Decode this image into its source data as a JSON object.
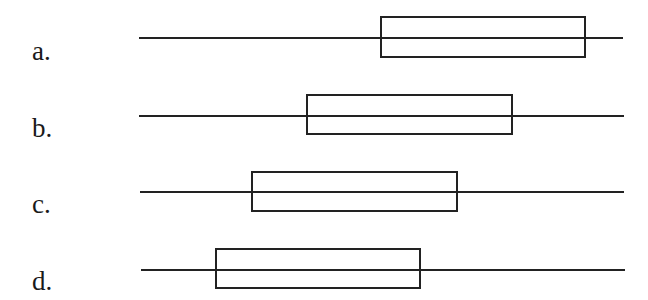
{
  "diagram": {
    "type": "interval-box-options",
    "stroke_color": "#222222",
    "rows": [
      {
        "label": "a.",
        "label_x": 32,
        "label_top": 38,
        "line_y": 38,
        "line_x1": 139,
        "line_x2": 623,
        "box_x1": 381,
        "box_x2": 585,
        "box_y1": 17,
        "box_y2": 57
      },
      {
        "label": "b.",
        "label_x": 32,
        "label_top": 115,
        "line_y": 116,
        "line_x1": 139,
        "line_x2": 624,
        "box_x1": 307,
        "box_x2": 512,
        "box_y1": 95,
        "box_y2": 134
      },
      {
        "label": "c.",
        "label_x": 32,
        "label_top": 191,
        "line_y": 192,
        "line_x1": 140,
        "line_x2": 624,
        "box_x1": 252,
        "box_x2": 457,
        "box_y1": 172,
        "box_y2": 211
      },
      {
        "label": "d.",
        "label_x": 32,
        "label_top": 268,
        "line_y": 270,
        "line_x1": 141,
        "line_x2": 625,
        "box_x1": 216,
        "box_x2": 420,
        "box_y1": 249,
        "box_y2": 288
      }
    ]
  }
}
